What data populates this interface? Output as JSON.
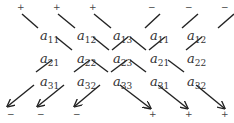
{
  "diagram": {
    "type": "sarrus-rule-determinant",
    "matrix": [
      [
        {
          "base": "a",
          "sub": "11"
        },
        {
          "base": "a",
          "sub": "12"
        },
        {
          "base": "a",
          "sub": "13"
        },
        {
          "base": "a",
          "sub": "11"
        },
        {
          "base": "a",
          "sub": "12"
        }
      ],
      [
        {
          "base": "a",
          "sub": "21"
        },
        {
          "base": "a",
          "sub": "22"
        },
        {
          "base": "a",
          "sub": "23"
        },
        {
          "base": "a",
          "sub": "21"
        },
        {
          "base": "a",
          "sub": "22"
        }
      ],
      [
        {
          "base": "a",
          "sub": "31"
        },
        {
          "base": "a",
          "sub": "32"
        },
        {
          "base": "a",
          "sub": "33"
        },
        {
          "base": "a",
          "sub": "31"
        },
        {
          "base": "a",
          "sub": "32"
        }
      ]
    ],
    "top_signs": [
      "+",
      "+",
      "+",
      "−",
      "−",
      "−"
    ],
    "bottom_signs": [
      "−",
      "−",
      "−",
      "+",
      "+",
      "+"
    ],
    "line_color": "#222222"
  }
}
